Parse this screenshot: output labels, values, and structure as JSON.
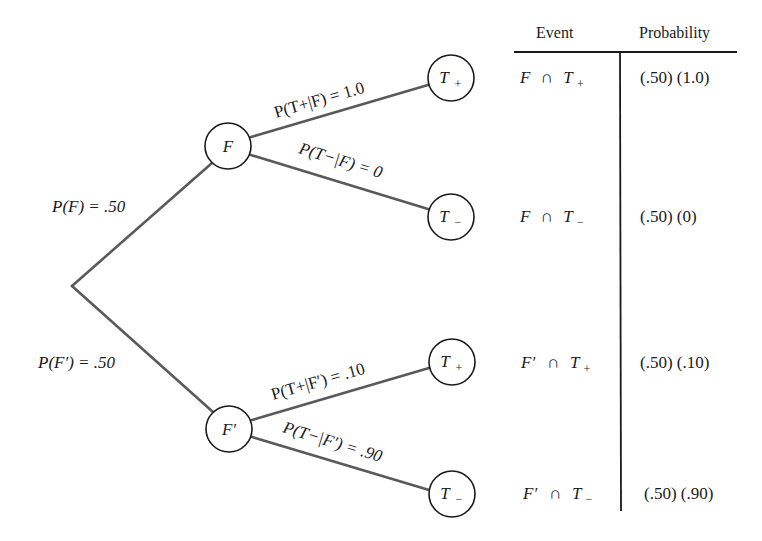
{
  "tree": {
    "root": {
      "label": ""
    },
    "first_level": [
      {
        "node": "F",
        "branch_label": "P(F) = .50",
        "prob": ".50"
      },
      {
        "node": "F′",
        "branch_label": "P(F′) = .50",
        "prob": ".50"
      }
    ],
    "second_level": [
      {
        "parent": "F",
        "node": "T+",
        "node_letter": "T",
        "node_sub": "+",
        "branch_label": "P(T+|F) = 1.0",
        "given": "F",
        "value": "1.0"
      },
      {
        "parent": "F",
        "node": "T−",
        "node_letter": "T",
        "node_sub": "−",
        "branch_label": "P(T−|F) = 0",
        "given": "F",
        "value": "0"
      },
      {
        "parent": "F′",
        "node": "T+",
        "node_letter": "T",
        "node_sub": "+",
        "branch_label": "P(T+|F′) = .10",
        "given": "F′",
        "value": ".10"
      },
      {
        "parent": "F′",
        "node": "T−",
        "node_letter": "T",
        "node_sub": "−",
        "branch_label": "P(T−|F′) = .90",
        "given": "F′",
        "value": ".90"
      }
    ]
  },
  "table": {
    "headers": {
      "event": "Event",
      "probability": "Probability"
    },
    "rows": [
      {
        "event_a": "F",
        "event_b": "T",
        "event_b_sub": "+",
        "probability": "(.50) (1.0)"
      },
      {
        "event_a": "F",
        "event_b": "T",
        "event_b_sub": "−",
        "probability": "(.50) (0)"
      },
      {
        "event_a": "F′",
        "event_b": "T",
        "event_b_sub": "+",
        "probability": "(.50) (.10)"
      },
      {
        "event_a": "F′",
        "event_b": "T",
        "event_b_sub": "−",
        "probability": "(.50) (.90)"
      }
    ]
  },
  "symbols": {
    "intersection": "∩",
    "equals": "=",
    "given_bar": "|",
    "P": "P"
  },
  "colors": {
    "edge": "#5a5a5a",
    "ink": "#1a1a1a",
    "background": "#ffffff"
  }
}
